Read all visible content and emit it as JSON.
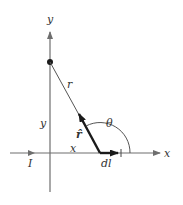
{
  "diagram": {
    "labels": {
      "y_axis": "y",
      "x_axis": "x",
      "r": "r",
      "y_dist": "y",
      "x_dist": "x",
      "theta": "θ",
      "r_hat": "r̂",
      "dl": "dl",
      "current": "I"
    },
    "colors": {
      "axis": "#6e6e6e",
      "vector": "#1a1a1a",
      "line": "#555555"
    }
  }
}
